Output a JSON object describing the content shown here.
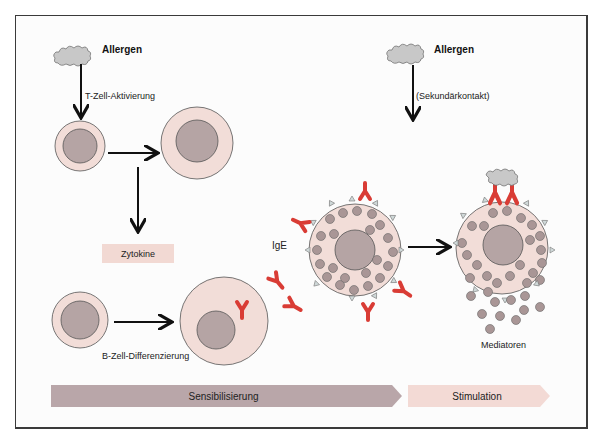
{
  "colors": {
    "cell_cytoplasm": "#f2ddd8",
    "cell_nucleus": "#b5a4a4",
    "granule": "#a99696",
    "ige": "#d93c35",
    "allergen": "#c8c8c8",
    "receptor": "#cfd8d8",
    "sensibilisierung_bar": "#b9a6a9",
    "stimulation_bar": "#f3dad5",
    "zytokine_box": "#f2d9d3"
  },
  "left_branch": {
    "allergen_label": "Allergen",
    "t_cell_label": "T-Zell-Aktivierung",
    "zytokine_label": "Zytokine",
    "b_cell_label": "B-Zell-Differenzierung",
    "ige_label": "IgE"
  },
  "right_branch": {
    "allergen_label": "Allergen",
    "secondary_label": "(Sekundärkontakt)",
    "mediators_label": "Mediatoren"
  },
  "phases": [
    {
      "label": "Sensibilisierung"
    },
    {
      "label": "Stimulation"
    }
  ]
}
